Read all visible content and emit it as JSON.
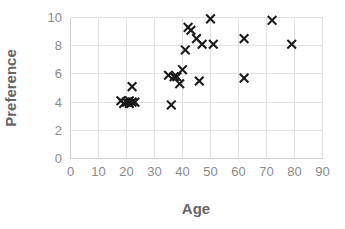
{
  "chart_data": {
    "type": "scatter",
    "title": "",
    "xlabel": "Age",
    "ylabel": "Preference",
    "xlim": [
      0,
      90
    ],
    "ylim": [
      0,
      10
    ],
    "xticks": [
      0,
      10,
      20,
      30,
      40,
      50,
      60,
      70,
      80,
      90
    ],
    "yticks": [
      0,
      2,
      4,
      6,
      8,
      10
    ],
    "xtick_labels": [
      "0",
      "10",
      "20",
      "30",
      "40",
      "50",
      "60",
      "70",
      "80",
      "90"
    ],
    "ytick_labels": [
      "0",
      "2",
      "4",
      "6",
      "8",
      "10"
    ],
    "grid": true,
    "legend": false,
    "legend_position": "none",
    "marker": "x",
    "marker_color": "#1a1a1a",
    "grid_color": "#e2e2e2",
    "label_color": "#666666",
    "tick_color": "#8a8a8a",
    "background": "#ffffff",
    "points": [
      {
        "x": 18,
        "y": 4.1
      },
      {
        "x": 19,
        "y": 3.9
      },
      {
        "x": 20,
        "y": 4.0
      },
      {
        "x": 21,
        "y": 4.1
      },
      {
        "x": 21,
        "y": 3.9
      },
      {
        "x": 22,
        "y": 5.1
      },
      {
        "x": 22,
        "y": 4.0
      },
      {
        "x": 23,
        "y": 4.0
      },
      {
        "x": 35,
        "y": 5.9
      },
      {
        "x": 36,
        "y": 3.8
      },
      {
        "x": 37,
        "y": 5.8
      },
      {
        "x": 38,
        "y": 5.8
      },
      {
        "x": 39,
        "y": 5.3
      },
      {
        "x": 40,
        "y": 6.3
      },
      {
        "x": 41,
        "y": 7.7
      },
      {
        "x": 42,
        "y": 9.3
      },
      {
        "x": 43,
        "y": 9.1
      },
      {
        "x": 45,
        "y": 8.5
      },
      {
        "x": 46,
        "y": 5.5
      },
      {
        "x": 47,
        "y": 8.1
      },
      {
        "x": 50,
        "y": 9.9
      },
      {
        "x": 51,
        "y": 8.1
      },
      {
        "x": 62,
        "y": 8.5
      },
      {
        "x": 62,
        "y": 5.7
      },
      {
        "x": 72,
        "y": 9.8
      },
      {
        "x": 79,
        "y": 8.1
      }
    ]
  }
}
